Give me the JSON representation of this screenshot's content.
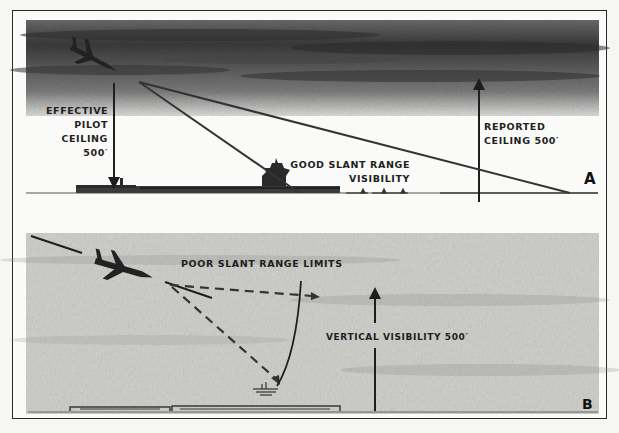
{
  "figure": {
    "panel_a": {
      "letter": "A",
      "labels": {
        "effective_pilot_ceiling": [
          "EFFECTIVE",
          "PILOT",
          "CEILING",
          "500′"
        ],
        "reported_ceiling": [
          "REPORTED",
          "CEILING 500′"
        ],
        "good_slant_range": [
          "GOOD SLANT RANGE",
          "VISIBILITY"
        ]
      }
    },
    "panel_b": {
      "letter": "B",
      "labels": {
        "poor_slant_range": "POOR SLANT RANGE LIMITS",
        "vertical_visibility": "VERTICAL VISIBILITY 500′"
      }
    },
    "colors": {
      "ink": "#1e1e1e",
      "cloud_dark": "#3c3c3c",
      "cloud_mid": "#8a8a8a",
      "fog": "#c9c9c6",
      "paper": "#fafaf8"
    }
  }
}
